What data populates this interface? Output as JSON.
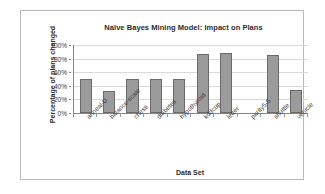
{
  "chart_data": {
    "type": "bar",
    "title": "Naïve Bayes Mining Model: Impact on Plans",
    "xlabel": "Data Set",
    "ylabel": "Percentage of plans changed",
    "categories": [
      "anneal-U",
      "balance-scale",
      "chess",
      "diabetes",
      "hypothyroid",
      "kddcup",
      "letter",
      "parity5-5",
      "shuttle",
      "vehicle"
    ],
    "values": [
      50,
      33,
      50,
      50,
      50,
      87,
      88,
      0,
      85,
      34
    ],
    "value_labels": [
      "50%",
      "33%",
      "50%",
      "50%",
      "50%",
      "87%",
      "88%",
      "0%",
      "85%",
      "34%"
    ],
    "ylim": [
      0,
      100
    ],
    "ytick_labels": [
      "0%",
      "20%",
      "40%",
      "60%",
      "80%",
      "100%"
    ],
    "ytick_values": [
      0,
      20,
      40,
      60,
      80,
      100
    ],
    "grid": true,
    "legend": false,
    "bar_color": "#9b9b9b",
    "bar_border_color": "#6a6a6a",
    "gridline_color": "#dadada",
    "axis_color": "#868686",
    "frame_color": "#b9b9b9",
    "background": "#ffffff"
  }
}
